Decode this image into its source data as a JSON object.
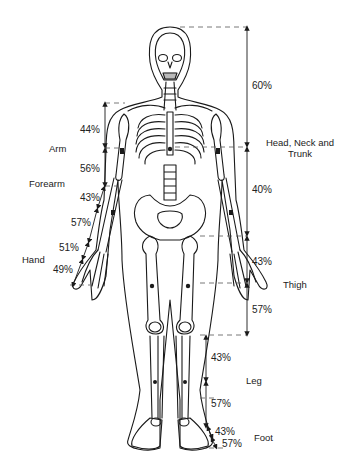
{
  "diagram": {
    "colors": {
      "line": "#1a1a1a",
      "dash": "#555555",
      "background": "#ffffff"
    }
  },
  "segments": {
    "head_neck_trunk": {
      "label": "Head, Neck and",
      "label2": "Trunk",
      "upper": "60%",
      "lower": "40%"
    },
    "arm": {
      "label": "Arm",
      "upper": "44%",
      "lower": "56%"
    },
    "forearm": {
      "label": "Forearm",
      "upper": "43%",
      "lower": "57%"
    },
    "hand": {
      "label": "Hand",
      "upper": "51%",
      "lower": "49%"
    },
    "thigh": {
      "label": "Thigh",
      "upper": "43%",
      "lower": "57%"
    },
    "leg": {
      "label": "Leg",
      "upper": "43%",
      "lower": "57%"
    },
    "foot": {
      "label": "Foot",
      "upper": "43%",
      "lower": "57%"
    }
  }
}
